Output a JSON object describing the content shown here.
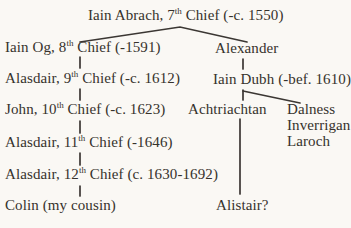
{
  "tree": {
    "description": "hand-drawn family tree of clan chiefs",
    "colors": {
      "background": "#faf8f4",
      "text": "#36322c",
      "line": "#3b3733"
    },
    "nodes": [
      {
        "name": "iain-abrach-7th-chief",
        "pre": "Iain Abrach, 7",
        "sup": "th",
        "post": " Chief (-c. 1550)"
      },
      {
        "name": "iain-og-8th-chief",
        "pre": "Iain Og, 8",
        "sup": "th",
        "post": " Chief (-1591)"
      },
      {
        "name": "alexander",
        "pre": "Alexander"
      },
      {
        "name": "alasdair-9th-chief",
        "pre": "Alasdair, 9",
        "sup": "th",
        "post": " Chief (-c. 1612)"
      },
      {
        "name": "iain-dubh",
        "pre": "Iain Dubh (-bef. 1610)"
      },
      {
        "name": "john-10th-chief",
        "pre": "John, 10",
        "sup": "th",
        "post": " Chief (-c. 1623)"
      },
      {
        "name": "achtriachtan",
        "pre": "Achtriachtan"
      },
      {
        "name": "dalness",
        "pre": "Dalness"
      },
      {
        "name": "inverrigan",
        "pre": "Inverrigan"
      },
      {
        "name": "alasdair-11th-chief",
        "pre": "Alasdair, 11",
        "sup": "th",
        "post": " Chief (-1646)"
      },
      {
        "name": "laroch",
        "pre": "Laroch"
      },
      {
        "name": "alasdair-12th-chief",
        "pre": "Alasdair, 12",
        "sup": "th",
        "post": " Chief (c. 1630-1692)"
      },
      {
        "name": "colin",
        "pre": "Colin (my cousin)"
      },
      {
        "name": "alistair",
        "pre": "Alistair?"
      }
    ],
    "edges": [
      {
        "from": "iain-abrach-7th-chief",
        "to": "iain-og-8th-chief"
      },
      {
        "from": "iain-abrach-7th-chief",
        "to": "alexander"
      },
      {
        "from": "iain-og-8th-chief",
        "to": "alasdair-9th-chief"
      },
      {
        "from": "alexander",
        "to": "iain-dubh"
      },
      {
        "from": "alasdair-9th-chief",
        "to": "john-10th-chief"
      },
      {
        "from": "iain-dubh",
        "to": "achtriachtan"
      },
      {
        "from": "iain-dubh",
        "to": "dalness"
      },
      {
        "from": "john-10th-chief",
        "to": "alasdair-11th-chief"
      },
      {
        "from": "alasdair-11th-chief",
        "to": "alasdair-12th-chief"
      },
      {
        "from": "alasdair-12th-chief",
        "to": "colin"
      },
      {
        "from": "achtriachtan",
        "to": "alistair"
      }
    ]
  }
}
